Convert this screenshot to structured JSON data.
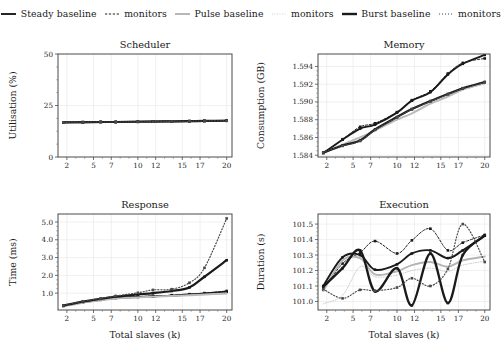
{
  "figure": {
    "title": "",
    "xlabel_shared": "Total slaves (k)"
  },
  "legend": {
    "position": "top-center",
    "entries": [
      {
        "label": "Steady baseline",
        "style": "solid",
        "color": "#1a1a1a",
        "width": 1.9,
        "name": "steady-baseline"
      },
      {
        "label": "monitors",
        "style": "dashed",
        "color": "#1a1a1a",
        "width": 1.0,
        "name": "steady-monitors"
      },
      {
        "label": "Pulse baseline",
        "style": "solid",
        "color": "#b4b4b4",
        "width": 1.9,
        "name": "pulse-baseline"
      },
      {
        "label": "monitors",
        "style": "dotted",
        "color": "#c8c8c8",
        "width": 1.0,
        "name": "pulse-monitors"
      },
      {
        "label": "Burst baseline",
        "style": "solid",
        "color": "#1a1a1a",
        "width": 2.4,
        "name": "burst-baseline"
      },
      {
        "label": "monitors",
        "style": "dotted",
        "color": "#4a4a4a",
        "width": 1.2,
        "name": "burst-monitors"
      }
    ]
  },
  "chart_data": [
    {
      "id": "scheduler",
      "type": "line",
      "title": "Scheduler",
      "xlabel": "",
      "ylabel": "Utilisation (%)",
      "xlim": [
        1.0,
        20.6
      ],
      "ylim": [
        0,
        50
      ],
      "xticks": [
        2,
        5,
        7,
        10,
        12,
        15,
        17,
        20
      ],
      "yticks": [
        0,
        25,
        50
      ],
      "ytick_labels": [
        "0",
        "25",
        "50"
      ],
      "grid": true,
      "x": [
        1.6,
        3.8,
        5.8,
        7.5,
        10.0,
        11.7,
        13.8,
        15.8,
        17.5,
        20.0
      ],
      "series": [
        {
          "name": "Steady baseline",
          "style": "solid",
          "color": "#1a1a1a",
          "width": 1.9,
          "marker": "square",
          "values": [
            16.8,
            16.9,
            17.0,
            17.0,
            17.1,
            17.2,
            17.3,
            17.4,
            17.5,
            17.6
          ]
        },
        {
          "name": "Steady monitors",
          "style": "dashed",
          "color": "#1a1a1a",
          "width": 1.0,
          "marker": "square",
          "values": [
            16.8,
            16.9,
            17.0,
            17.0,
            17.1,
            17.2,
            17.3,
            17.4,
            17.5,
            17.6
          ]
        },
        {
          "name": "Pulse baseline",
          "style": "solid",
          "color": "#b4b4b4",
          "width": 1.9,
          "marker": "none",
          "values": [
            16.7,
            16.8,
            16.9,
            17.0,
            17.1,
            17.1,
            17.2,
            17.3,
            17.4,
            17.5
          ]
        },
        {
          "name": "Pulse monitors",
          "style": "dotted",
          "color": "#c8c8c8",
          "width": 1.0,
          "marker": "none",
          "values": [
            16.7,
            16.8,
            16.9,
            17.0,
            17.1,
            17.1,
            17.2,
            17.3,
            17.4,
            17.5
          ]
        },
        {
          "name": "Burst baseline",
          "style": "solid",
          "color": "#1a1a1a",
          "width": 2.2,
          "marker": "square",
          "values": [
            16.8,
            16.9,
            17.0,
            17.0,
            17.1,
            17.2,
            17.3,
            17.4,
            17.5,
            17.6
          ]
        },
        {
          "name": "Burst monitors",
          "style": "dotted",
          "color": "#4a4a4a",
          "width": 1.1,
          "marker": "square",
          "values": [
            16.8,
            16.9,
            17.0,
            17.0,
            17.1,
            17.2,
            17.3,
            17.4,
            17.5,
            17.6
          ]
        }
      ]
    },
    {
      "id": "memory",
      "type": "line",
      "title": "Memory",
      "xlabel": "",
      "ylabel": "Consumption (GB)",
      "xlim": [
        1.0,
        20.6
      ],
      "ylim": [
        1.5838,
        1.5954
      ],
      "xticks": [
        2,
        5,
        7,
        10,
        12,
        15,
        17,
        20
      ],
      "yticks": [
        1.584,
        1.586,
        1.588,
        1.59,
        1.592,
        1.594
      ],
      "ytick_labels": [
        "1.584",
        "1.586",
        "1.588",
        "1.590",
        "1.592",
        "1.594"
      ],
      "grid": true,
      "x": [
        1.6,
        3.8,
        5.8,
        7.5,
        10.0,
        11.7,
        13.8,
        15.8,
        17.5,
        20.0
      ],
      "series": [
        {
          "name": "Steady baseline",
          "style": "solid",
          "color": "#1a1a1a",
          "width": 1.9,
          "marker": "square",
          "values": [
            1.58425,
            1.58575,
            1.587,
            1.58745,
            1.5888,
            1.59015,
            1.5911,
            1.5931,
            1.5943,
            1.5953
          ]
        },
        {
          "name": "Steady monitors",
          "style": "dashed",
          "color": "#1a1a1a",
          "width": 1.0,
          "marker": "square",
          "values": [
            1.58425,
            1.5858,
            1.5872,
            1.5876,
            1.58885,
            1.5902,
            1.5912,
            1.5932,
            1.5944,
            1.5949
          ]
        },
        {
          "name": "Pulse baseline",
          "style": "solid",
          "color": "#b4b4b4",
          "width": 1.9,
          "marker": "none",
          "values": [
            1.58425,
            1.5852,
            1.586,
            1.5868,
            1.588,
            1.5887,
            1.5898,
            1.5906,
            1.5914,
            1.5921
          ]
        },
        {
          "name": "Pulse monitors",
          "style": "dotted",
          "color": "#c8c8c8",
          "width": 1.0,
          "marker": "none",
          "values": [
            1.58425,
            1.58515,
            1.58595,
            1.58675,
            1.58795,
            1.58865,
            1.58975,
            1.59055,
            1.59135,
            1.59205
          ]
        },
        {
          "name": "Burst baseline",
          "style": "solid",
          "color": "#1a1a1a",
          "width": 2.2,
          "marker": "square",
          "values": [
            1.5843,
            1.5851,
            1.58565,
            1.5869,
            1.5883,
            1.5892,
            1.5901,
            1.5909,
            1.59155,
            1.59225
          ]
        },
        {
          "name": "Burst monitors",
          "style": "dotted",
          "color": "#4a4a4a",
          "width": 1.1,
          "marker": "square",
          "values": [
            1.5843,
            1.58505,
            1.5856,
            1.58685,
            1.58825,
            1.58915,
            1.59005,
            1.59085,
            1.5915,
            1.5922
          ]
        }
      ]
    },
    {
      "id": "response",
      "type": "line",
      "title": "Response",
      "xlabel": "Total slaves (k)",
      "ylabel": "Time (ms)",
      "xlim": [
        1.0,
        20.6
      ],
      "ylim": [
        0.05,
        5.45
      ],
      "xticks": [
        2,
        5,
        7,
        10,
        12,
        15,
        17,
        20
      ],
      "yticks": [
        1.0,
        2.0,
        3.0,
        4.0,
        5.0
      ],
      "ytick_labels": [
        "1.0",
        "2.0",
        "3.0",
        "4.0",
        "5.0"
      ],
      "grid": true,
      "x": [
        1.6,
        3.8,
        5.8,
        7.5,
        10.0,
        11.7,
        13.8,
        15.8,
        17.5,
        20.0
      ],
      "series": [
        {
          "name": "Steady baseline",
          "style": "solid",
          "color": "#1a1a1a",
          "width": 1.9,
          "marker": "square",
          "values": [
            0.28,
            0.48,
            0.62,
            0.72,
            0.78,
            0.82,
            0.86,
            0.92,
            0.98,
            1.08
          ]
        },
        {
          "name": "Steady monitors",
          "style": "dashed",
          "color": "#1a1a1a",
          "width": 1.0,
          "marker": "square",
          "values": [
            0.28,
            0.5,
            0.64,
            0.74,
            0.8,
            0.84,
            0.88,
            0.94,
            1.0,
            1.12
          ]
        },
        {
          "name": "Pulse baseline",
          "style": "solid",
          "color": "#b4b4b4",
          "width": 1.9,
          "marker": "none",
          "values": [
            0.26,
            0.46,
            0.6,
            0.7,
            0.76,
            0.8,
            0.84,
            0.88,
            0.92,
            0.98
          ]
        },
        {
          "name": "Pulse monitors",
          "style": "dotted",
          "color": "#c8c8c8",
          "width": 1.0,
          "marker": "none",
          "values": [
            0.26,
            0.46,
            0.6,
            0.7,
            0.76,
            0.8,
            0.84,
            0.88,
            0.92,
            1.0
          ]
        },
        {
          "name": "Burst baseline",
          "style": "solid",
          "color": "#1a1a1a",
          "width": 2.2,
          "marker": "square",
          "values": [
            0.3,
            0.52,
            0.68,
            0.8,
            0.92,
            1.0,
            1.12,
            1.32,
            1.92,
            2.85
          ]
        },
        {
          "name": "Burst monitors",
          "style": "dotted",
          "color": "#4a4a4a",
          "width": 1.2,
          "marker": "square",
          "values": [
            0.3,
            0.54,
            0.7,
            0.84,
            1.02,
            1.18,
            1.22,
            1.58,
            2.42,
            5.2
          ]
        }
      ]
    },
    {
      "id": "execution",
      "type": "line",
      "title": "Execution",
      "xlabel": "Total slaves (k)",
      "ylabel": "Duration (s)",
      "xlim": [
        1.0,
        20.6
      ],
      "ylim": [
        100.945,
        101.565
      ],
      "xticks": [
        2,
        5,
        7,
        10,
        12,
        15,
        17,
        20
      ],
      "yticks": [
        101.0,
        101.1,
        101.2,
        101.3,
        101.4,
        101.5
      ],
      "ytick_labels": [
        "101.0",
        "101.1",
        "101.2",
        "101.3",
        "101.4",
        "101.5"
      ],
      "grid": true,
      "x": [
        1.6,
        3.8,
        5.8,
        7.5,
        10.0,
        11.7,
        13.8,
        15.8,
        17.5,
        20.0
      ],
      "series": [
        {
          "name": "Steady baseline",
          "style": "solid",
          "color": "#1a1a1a",
          "width": 1.9,
          "marker": "square",
          "values": [
            101.1,
            101.285,
            101.3,
            101.205,
            101.24,
            101.31,
            101.33,
            101.28,
            101.33,
            101.425
          ]
        },
        {
          "name": "Steady monitors",
          "style": "dashed",
          "color": "#1a1a1a",
          "width": 1.0,
          "marker": "square",
          "values": [
            101.075,
            101.245,
            101.315,
            101.39,
            101.31,
            101.395,
            101.47,
            101.33,
            101.38,
            101.43
          ]
        },
        {
          "name": "Pulse baseline",
          "style": "solid",
          "color": "#b4b4b4",
          "width": 1.9,
          "marker": "none",
          "values": [
            101.07,
            101.265,
            101.28,
            101.175,
            101.195,
            101.235,
            101.255,
            101.225,
            101.265,
            101.29
          ]
        },
        {
          "name": "Pulse monitors",
          "style": "dotted",
          "color": "#c8c8c8",
          "width": 1.0,
          "marker": "none",
          "values": [
            100.985,
            101.04,
            101.225,
            101.16,
            101.17,
            101.2,
            101.215,
            101.195,
            101.235,
            101.26
          ]
        },
        {
          "name": "Burst baseline",
          "style": "solid",
          "color": "#1a1a1a",
          "width": 2.3,
          "marker": "square",
          "values": [
            101.095,
            101.215,
            101.33,
            101.065,
            101.215,
            100.975,
            101.31,
            100.99,
            101.3,
            101.425
          ]
        },
        {
          "name": "Burst monitors",
          "style": "dotted",
          "color": "#4a4a4a",
          "width": 1.2,
          "marker": "square",
          "values": [
            101.08,
            101.02,
            101.075,
            101.07,
            101.09,
            101.15,
            101.1,
            101.21,
            101.5,
            101.255
          ]
        }
      ]
    }
  ]
}
